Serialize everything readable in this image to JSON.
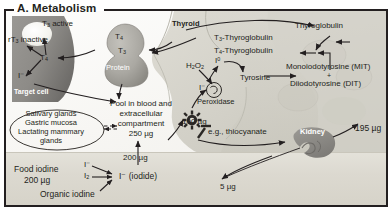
{
  "panel": {
    "title": "A. Metabolism"
  },
  "colors": {
    "frame": "#231f20",
    "target_cell": "#8c8a86",
    "target_cell_nucleus": "#f2f1ec",
    "protein_blob": "#a9a7a1",
    "thyroid_tissue": "#cfcdc4",
    "gut_band": "#dcd9d0",
    "kidney": "#8f8d88",
    "arrow": "#231f20",
    "text": "#231f20"
  },
  "target_cell": {
    "name": "Target cell",
    "t3_active": "T3 active",
    "t3_active_html": "T<sub>3</sub> active",
    "rt3_inactive": "rT3 inactive",
    "rt3_inactive_html": "rT<sub>3</sub> inactive",
    "t4": "T4",
    "t4_html": "T<sub>4</sub>",
    "iodide": "I⁻"
  },
  "protein_blob": {
    "t4": "T4",
    "t4_html": "T<sub>4</sub>",
    "t3": "T3",
    "t3_html": "T<sub>3</sub>",
    "protein": "Protein"
  },
  "thyroid": {
    "label": "Thyroid",
    "t3_thyroglobulin": "T3-Thyroglobulin",
    "t3_thyroglobulin_html": "T<sub>3</sub>-Thyroglobulin",
    "t4_thyroglobulin": "T4-Thyroglobulin",
    "t4_thyroglobulin_html": "T<sub>4</sub>-Thyroglobulin",
    "thyroglobulin": "Thyroglobulin",
    "monoiodotyrosine": "Monoiodotyrosine (MIT)",
    "plus": "+",
    "diiodotyrosine": "Diiodotyrosine (DIT)",
    "tyrosine": "Tyrosine",
    "peroxidase": "Peroxidase",
    "hydrogen_peroxide": "H2O2",
    "hydrogen_peroxide_html": "H<sub>2</sub>O<sub>2</sub>",
    "iodine_atom": "I0",
    "iodine_atom_html": "I<sup>0</sup>",
    "iodide": "I⁻",
    "inhibitor_note": "e.g., thiocyanate",
    "uptake_amount": "100 µg"
  },
  "pool": {
    "line1": "Pool in blood and",
    "line2": "extracellular",
    "line3": "compartment",
    "amount": "250 µg"
  },
  "secretory_glands": {
    "line1": "Salivary glands",
    "line2": "Gastric mucosa",
    "line3": "Lactating mammary",
    "line4": "glands"
  },
  "gut": {
    "food_iodine_label": "Food iodine",
    "food_iodine_amount": "200 µg",
    "organic_iodine": "Organic iodine",
    "iodide_ion": "I⁻",
    "iodine_molecule": "I2",
    "iodine_molecule_html": "I<sub>2</sub>",
    "iodide_named": "I⁻ (iodide)",
    "absorbed_amount": "200 µg",
    "fecal_loss": "5 µg"
  },
  "kidney": {
    "label": "Kidney",
    "excretion_amount": "195 µg"
  }
}
